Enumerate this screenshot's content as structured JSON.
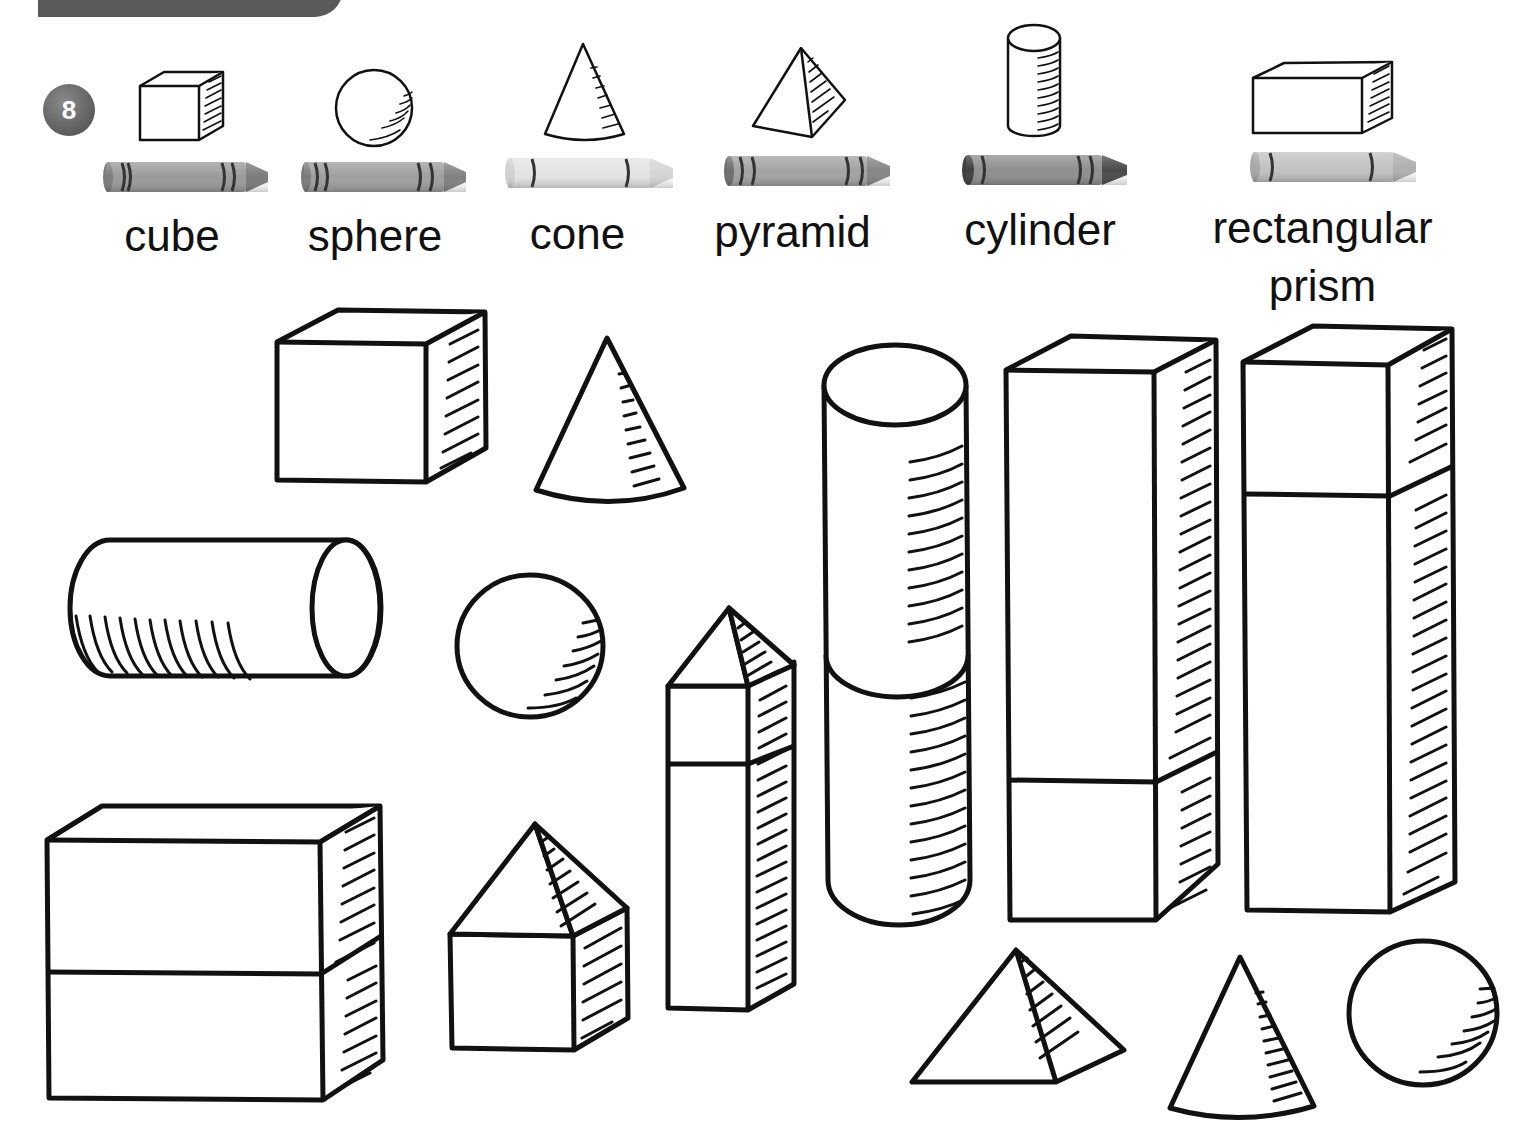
{
  "header": {
    "bar_color": "#5a5a5a"
  },
  "exercise": {
    "number": "8",
    "badge_color": "#6b6b6b"
  },
  "legend": [
    {
      "shape": "cube",
      "label": "cube",
      "crayon_color": "#9a9a9a",
      "crayon_tip": "#7a7a7a"
    },
    {
      "shape": "sphere",
      "label": "sphere",
      "crayon_color": "#9e9e9e",
      "crayon_tip": "#808080"
    },
    {
      "shape": "cone",
      "label": "cone",
      "crayon_color": "#e3e3e3",
      "crayon_tip": "#d5d5d5"
    },
    {
      "shape": "pyramid",
      "label": "pyramid",
      "crayon_color": "#a3a3a3",
      "crayon_tip": "#858585"
    },
    {
      "shape": "cylinder",
      "label": "cylinder",
      "crayon_color": "#8e8e8e",
      "crayon_tip": "#4a4a4a"
    },
    {
      "shape": "rectangular-prism",
      "label": "rectangular",
      "label_line2": "prism",
      "crayon_color": "#c2c2c2",
      "crayon_tip": "#b0b0b0"
    }
  ],
  "scene_shapes": [
    "cube",
    "cone",
    "cylinder-horizontal",
    "sphere",
    "pyramid-on-prism-tall",
    "cylinder-stacked-tall",
    "rectangular-prism-tall-1",
    "rectangular-prism-tall-2",
    "rectangular-prism-stacked-wide",
    "pyramid-on-cube",
    "pyramid",
    "cone",
    "sphere"
  ]
}
